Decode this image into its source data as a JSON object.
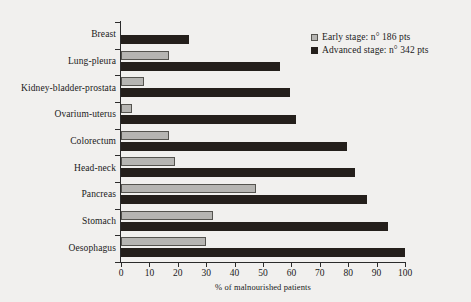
{
  "chart_data": {
    "type": "bar",
    "orientation": "horizontal",
    "title": "",
    "xlabel": "% of malnourished patients",
    "ylabel": "",
    "xlim": [
      0,
      100
    ],
    "xticks": [
      0,
      10,
      20,
      30,
      40,
      50,
      60,
      70,
      80,
      90,
      100
    ],
    "grid": false,
    "legend_position": "top-right",
    "categories": [
      "Breast",
      "Lung-pleura",
      "Kidney-bladder-prostata",
      "Ovarium-uterus",
      "Colorectum",
      "Head-neck",
      "Pancreas",
      "Stomach",
      "Oesophagus"
    ],
    "series": [
      {
        "name": "Early stage: n° 186 pts",
        "color": "#b6b5b2",
        "values": [
          0,
          17,
          8,
          4,
          17,
          19,
          47.5,
          32.5,
          30
        ]
      },
      {
        "name": "Advanced stage: n° 342 pts",
        "color": "#241f1b",
        "values": [
          24,
          56,
          59.5,
          61.5,
          79.5,
          82.5,
          86.5,
          94,
          100
        ]
      }
    ]
  },
  "legend": {
    "items": [
      {
        "label": "Early stage: n° 186 pts",
        "swatch": "early"
      },
      {
        "label": "Advanced stage: n° 342 pts",
        "swatch": "advanced"
      }
    ]
  },
  "axis": {
    "x_title": "% of malnourished patients",
    "x_tick_labels": [
      "0",
      "10",
      "20",
      "30",
      "40",
      "50",
      "60",
      "70",
      "80",
      "90",
      "100"
    ]
  },
  "colors": {
    "early_fill": "#b6b5b2",
    "early_border": "#55544f",
    "advanced_fill": "#241f1b",
    "axis": "#2b2b2b",
    "background": "#f1f0ee",
    "text": "#1a1a1a"
  }
}
